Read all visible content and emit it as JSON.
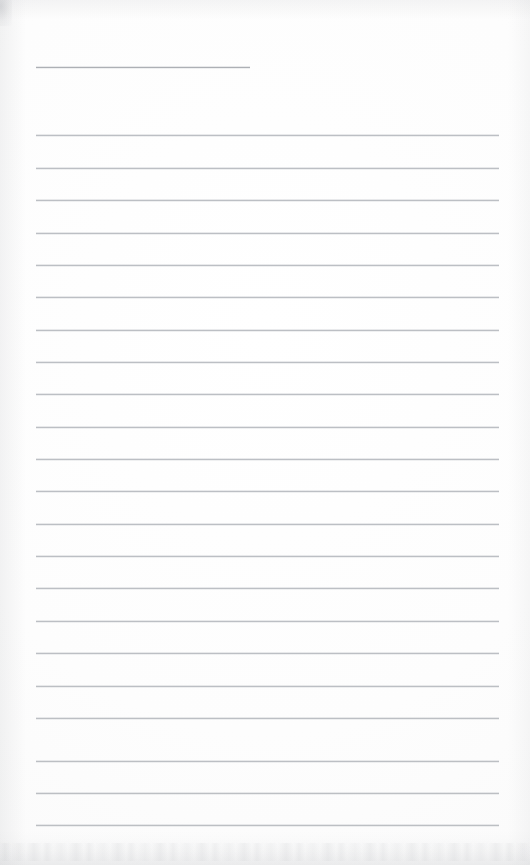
{
  "document": {
    "type": "scanned-lined-paper",
    "title": "Blank lined notebook page",
    "width_px": 530,
    "height_px": 865,
    "background_color": "#fdfdfd",
    "text_content": "",
    "has_handwriting": false,
    "has_printed_text": false
  },
  "ruling": {
    "line_color": "#b9bcc1",
    "first_line_color": "#a9acb2",
    "line_thickness_px": 1,
    "line_spacing_px": 32.3,
    "left_margin_px": 36,
    "right_edge_px": 499,
    "total_lines": 23,
    "lines": [
      {
        "id": "rule-1",
        "y": 67,
        "x": 36,
        "width": 214,
        "short": true
      },
      {
        "id": "rule-2",
        "y": 135,
        "x": 36,
        "width": 463,
        "short": false
      },
      {
        "id": "rule-3",
        "y": 168,
        "x": 36,
        "width": 463,
        "short": false
      },
      {
        "id": "rule-4",
        "y": 200,
        "x": 36,
        "width": 463,
        "short": false
      },
      {
        "id": "rule-5",
        "y": 233,
        "x": 36,
        "width": 463,
        "short": false
      },
      {
        "id": "rule-6",
        "y": 265,
        "x": 36,
        "width": 463,
        "short": false
      },
      {
        "id": "rule-7",
        "y": 297,
        "x": 36,
        "width": 463,
        "short": false
      },
      {
        "id": "rule-8",
        "y": 330,
        "x": 36,
        "width": 463,
        "short": false
      },
      {
        "id": "rule-9",
        "y": 362,
        "x": 36,
        "width": 463,
        "short": false
      },
      {
        "id": "rule-10",
        "y": 394,
        "x": 36,
        "width": 463,
        "short": false
      },
      {
        "id": "rule-11",
        "y": 427,
        "x": 36,
        "width": 463,
        "short": false
      },
      {
        "id": "rule-12",
        "y": 459,
        "x": 36,
        "width": 463,
        "short": false
      },
      {
        "id": "rule-13",
        "y": 491,
        "x": 36,
        "width": 463,
        "short": false
      },
      {
        "id": "rule-14",
        "y": 524,
        "x": 36,
        "width": 463,
        "short": false
      },
      {
        "id": "rule-15",
        "y": 556,
        "x": 36,
        "width": 463,
        "short": false
      },
      {
        "id": "rule-16",
        "y": 588,
        "x": 36,
        "width": 463,
        "short": false
      },
      {
        "id": "rule-17",
        "y": 621,
        "x": 36,
        "width": 463,
        "short": false
      },
      {
        "id": "rule-18",
        "y": 653,
        "x": 36,
        "width": 463,
        "short": false
      },
      {
        "id": "rule-19",
        "y": 686,
        "x": 36,
        "width": 463,
        "short": false
      },
      {
        "id": "rule-20",
        "y": 718,
        "x": 36,
        "width": 463,
        "short": false
      },
      {
        "id": "rule-21",
        "y": 761,
        "x": 36,
        "width": 463,
        "short": false
      },
      {
        "id": "rule-22",
        "y": 793,
        "x": 36,
        "width": 463,
        "short": false
      },
      {
        "id": "rule-23",
        "y": 825,
        "x": 36,
        "width": 463,
        "short": false
      }
    ]
  },
  "artifacts": {
    "corner_smudge": {
      "position": "top-left",
      "color": "#a8aab0"
    },
    "bottom_noise_band": {
      "height_px": 34,
      "color": "#babcc0"
    },
    "edge_shading_color": "#b4b6ba"
  }
}
